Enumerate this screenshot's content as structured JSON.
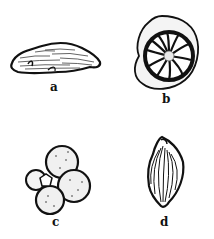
{
  "figure": {
    "panels": [
      {
        "id": "a",
        "label": "a",
        "description": "elongated spindle-shaped specimen with fine striations"
      },
      {
        "id": "b",
        "label": "b",
        "description": "coiled planispiral test with radiating chambers"
      },
      {
        "id": "c",
        "label": "c",
        "description": "globular chambered test with trochospiral arrangement"
      },
      {
        "id": "d",
        "label": "d",
        "description": "leaf/ovoid shaped test with longitudinal ribs"
      }
    ],
    "colors": {
      "ink": "#111111",
      "background": "#ffffff"
    }
  }
}
